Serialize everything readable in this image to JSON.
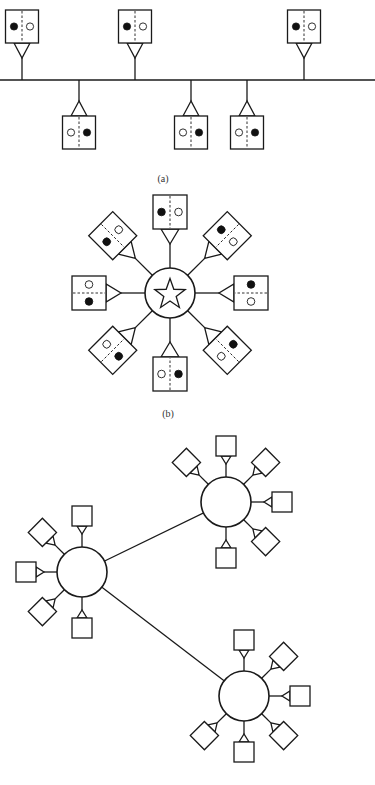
{
  "colors": {
    "stroke": "#1a1a1a",
    "background": "#ffffff",
    "filled_dot": "#111111"
  },
  "captions": [
    {
      "id": "a",
      "label": "(a)",
      "x": 163,
      "y": 178
    },
    {
      "id": "b",
      "label": "(b)",
      "x": 168,
      "y": 413
    }
  ],
  "bus_topology": {
    "caption": "(a)",
    "bus": {
      "x1": 0,
      "x2": 375,
      "y": 80
    },
    "box_size": 33,
    "triangle_height": 15,
    "triangle_half_width": 8,
    "nodes": [
      {
        "side": "top",
        "x": 22,
        "box_top": 10,
        "left_dot": "filled",
        "right_dot": "open"
      },
      {
        "side": "top",
        "x": 135,
        "box_top": 10,
        "left_dot": "filled",
        "right_dot": "open"
      },
      {
        "side": "top",
        "x": 304,
        "box_top": 10,
        "left_dot": "filled",
        "right_dot": "open"
      },
      {
        "side": "bottom",
        "x": 79,
        "box_top": 116,
        "left_dot": "open",
        "right_dot": "filled"
      },
      {
        "side": "bottom",
        "x": 191,
        "box_top": 116,
        "left_dot": "open",
        "right_dot": "filled"
      },
      {
        "side": "bottom",
        "x": 247,
        "box_top": 116,
        "left_dot": "open",
        "right_dot": "filled"
      }
    ]
  },
  "star_topology": {
    "caption": "(b)",
    "hub": {
      "cx": 170,
      "cy": 293,
      "r": 25,
      "icon": "star-icon"
    },
    "box_size": 34,
    "box_distance": 81,
    "triangle_height": 15,
    "triangle_half_width": 9,
    "nodes": [
      {
        "angle": -90,
        "near_dot": "filled",
        "far_dot": "open"
      },
      {
        "angle": -45,
        "near_dot": "filled",
        "far_dot": "open"
      },
      {
        "angle": 0,
        "near_dot": "filled",
        "far_dot": "open"
      },
      {
        "angle": 45,
        "near_dot": "filled",
        "far_dot": "open"
      },
      {
        "angle": 90,
        "near_dot": "filled",
        "far_dot": "open"
      },
      {
        "angle": 135,
        "near_dot": "filled",
        "far_dot": "open"
      },
      {
        "angle": 180,
        "near_dot": "filled",
        "far_dot": "open"
      },
      {
        "angle": -135,
        "near_dot": "filled",
        "far_dot": "open"
      }
    ]
  },
  "network_topology": {
    "box_size": 20,
    "box_distance": 56,
    "triangle_height": 8,
    "triangle_half_width": 5,
    "hub_radius": 25,
    "hubs": [
      {
        "id": "hub-top-right",
        "cx": 226,
        "cy": 502,
        "spokes": [
          -90,
          -135,
          -45,
          0,
          45,
          90
        ]
      },
      {
        "id": "hub-left",
        "cx": 82,
        "cy": 572,
        "spokes": [
          -90,
          -135,
          180,
          135,
          90
        ]
      },
      {
        "id": "hub-bottom-right",
        "cx": 244,
        "cy": 696,
        "spokes": [
          -90,
          -45,
          0,
          45,
          90,
          135
        ]
      }
    ],
    "links": [
      {
        "from": "hub-left",
        "to": "hub-top-right"
      },
      {
        "from": "hub-left",
        "to": "hub-bottom-right"
      }
    ]
  }
}
